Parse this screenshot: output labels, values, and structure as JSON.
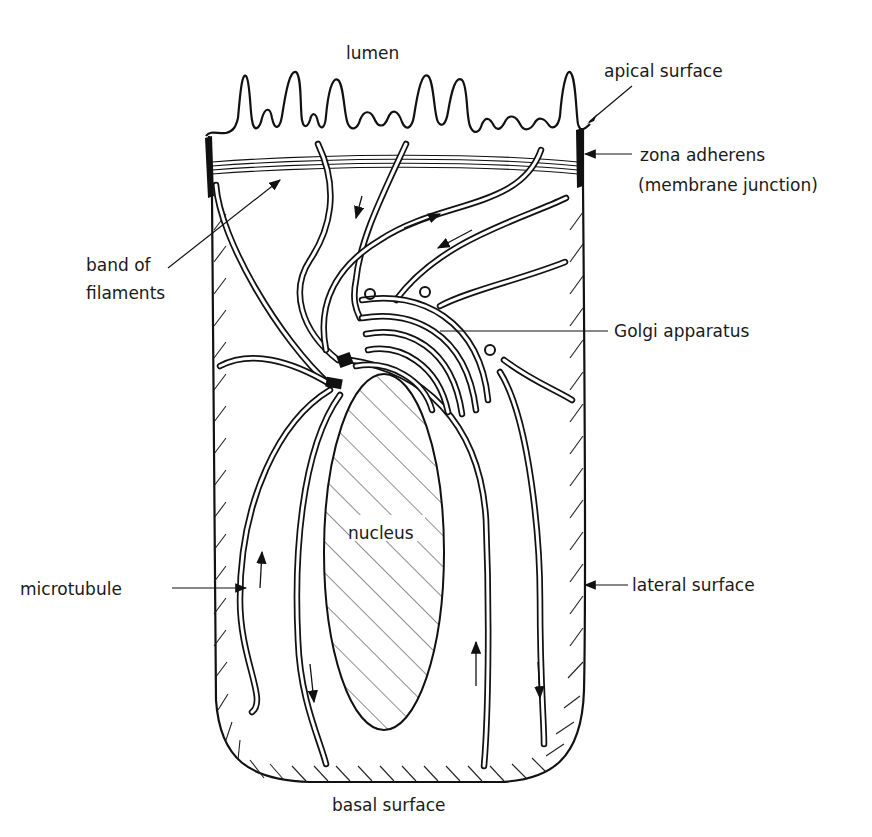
{
  "figure": {
    "labels": {
      "lumen": "lumen",
      "apical_surface": "apical surface",
      "zona_adherens": "zona adherens",
      "zona_adherens_sub": "(membrane junction)",
      "band_of_filaments_1": "band of",
      "band_of_filaments_2": "filaments",
      "golgi": "Golgi apparatus",
      "nucleus": "nucleus",
      "microtubule": "microtubule",
      "lateral_surface": "lateral surface",
      "basal_surface": "basal surface"
    },
    "colors": {
      "ink": "#111111",
      "background": "#ffffff"
    }
  }
}
